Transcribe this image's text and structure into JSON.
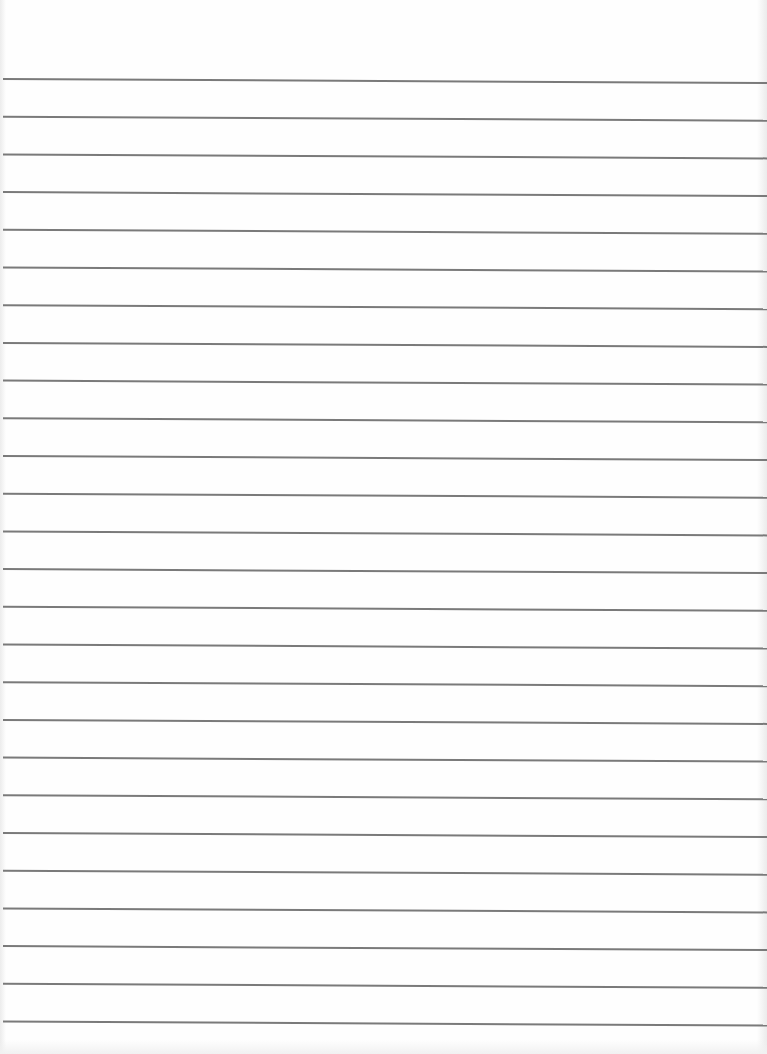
{
  "document": {
    "type": "lined-paper",
    "background_color": "#fefefe",
    "rule_color": "#7a7a7a",
    "rule_count": 26,
    "first_rule_y_left": 79,
    "first_rule_y_right": 83,
    "rule_spacing": 37.7,
    "rule_width": 2,
    "text": ""
  }
}
